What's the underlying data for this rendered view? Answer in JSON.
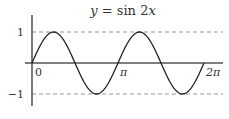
{
  "chart_data": {
    "type": "line",
    "title": "y = sin 2x",
    "title_parts": {
      "lhs": "y",
      "eq": " = ",
      "fn": "sin",
      "arg": "2x"
    },
    "xlabel": "",
    "ylabel": "",
    "x_ticks": [
      "0",
      "π",
      "2π"
    ],
    "y_ticks": [
      "1",
      "−1"
    ],
    "xlim": [
      0,
      6.2832
    ],
    "ylim": [
      -1,
      1
    ],
    "grid": false,
    "reference_lines": [
      {
        "y": 1,
        "style": "dashed"
      },
      {
        "y": -1,
        "style": "dashed"
      }
    ],
    "series": [
      {
        "name": "sin 2x",
        "function": "sin(2x)",
        "x": [
          0,
          0.7854,
          1.5708,
          2.3562,
          3.1416,
          3.927,
          4.7124,
          5.4978,
          6.2832
        ],
        "values": [
          0,
          1,
          0,
          -1,
          0,
          1,
          0,
          -1,
          0
        ]
      }
    ],
    "colors": {
      "curve": "#222222",
      "axis": "#444444",
      "dashed": "#999999",
      "text": "#333333"
    }
  }
}
